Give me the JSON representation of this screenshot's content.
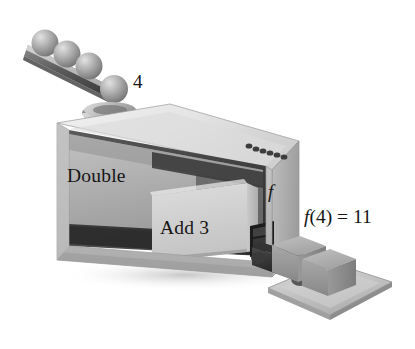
{
  "figure": {
    "type": "function-machine-illustration",
    "palette": {
      "background": "#ffffff",
      "box_top_face": "#e6e6e6",
      "box_front_face": "#b5b5b5",
      "box_right_face": "#acacac",
      "inner_panel_double": "#b0b0b0",
      "inner_panel_add3": "#d2d2d2",
      "interior_shadow": "#3a3a3a",
      "ramp": "#595959",
      "sphere": "#9a9a9a",
      "cube": "#9c9c9c",
      "tray": "#c4c4c4",
      "text": "#151515"
    },
    "labels": {
      "input_value": "4",
      "operation_first": "Double",
      "operation_second": "Add 3",
      "function_name": "f",
      "result_lhs_f": "f",
      "result_rest": "(4) = 11",
      "result_full": "f(4) = 11"
    },
    "objects": {
      "input_spheres_count": 4,
      "output_cubes_count": 2,
      "ramp_name": "input-ramp",
      "funnel_name": "input-funnel",
      "slot_name": "output-slot",
      "tray_name": "output-tray",
      "knobs_count": 6
    }
  }
}
